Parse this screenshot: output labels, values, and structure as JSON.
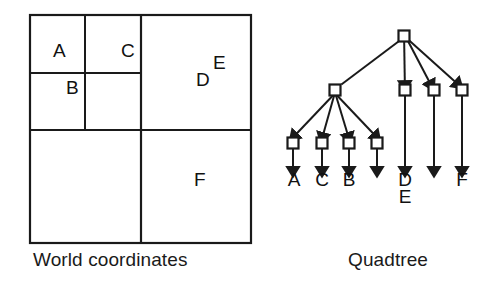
{
  "figure": {
    "stroke_color": "#1a1a1a",
    "background_color": "#ffffff"
  },
  "world_panel": {
    "caption": "World coordinates",
    "box": {
      "x": 30,
      "y": 15,
      "width": 221,
      "height": 228
    },
    "dividers": {
      "main_vertical_x": 141,
      "main_horizontal_y": 130,
      "ul_vertical_x": 85,
      "ul_horizontal_y": 73
    },
    "regions": [
      {
        "label": "A",
        "x": 53,
        "y": 51
      },
      {
        "label": "C",
        "x": 121,
        "y": 51
      },
      {
        "label": "B",
        "x": 66,
        "y": 88
      },
      {
        "label": "D",
        "x": 196,
        "y": 80
      },
      {
        "label": "E",
        "x": 212,
        "y": 63
      },
      {
        "label": "F",
        "x": 194,
        "y": 180
      }
    ]
  },
  "quadtree_panel": {
    "caption": "Quadtree",
    "root": {
      "x": 404,
      "y": 36
    },
    "level2": [
      {
        "x": 335,
        "y": 90
      },
      {
        "x": 405,
        "y": 90
      },
      {
        "x": 434,
        "y": 90
      },
      {
        "x": 462,
        "y": 90
      }
    ],
    "level3": [
      {
        "x": 293,
        "y": 143
      },
      {
        "x": 322,
        "y": 143
      },
      {
        "x": 349,
        "y": 143
      },
      {
        "x": 377,
        "y": 143
      }
    ],
    "leaf_labels": [
      {
        "label": "A",
        "x": 293,
        "y": 176
      },
      {
        "label": "C",
        "x": 322,
        "y": 176
      },
      {
        "label": "B",
        "x": 349,
        "y": 176
      },
      {
        "label": "",
        "x": 377,
        "y": 176
      },
      {
        "label": "D",
        "x": 405,
        "y": 176
      },
      {
        "label": "E",
        "x": 405,
        "y": 193
      },
      {
        "label": "",
        "x": 434,
        "y": 176
      },
      {
        "label": "F",
        "x": 462,
        "y": 176
      }
    ],
    "node_size": 11,
    "arrow_tip_y": 168
  }
}
